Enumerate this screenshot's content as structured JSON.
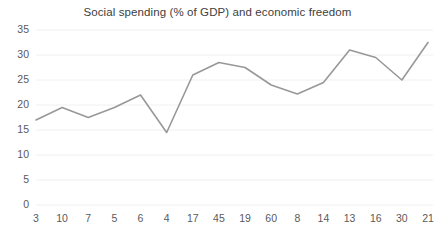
{
  "chart_data": {
    "type": "line",
    "title": "Social spending (% of GDP) and economic freedom",
    "xlabel": "",
    "ylabel": "",
    "categories": [
      "3",
      "10",
      "7",
      "5",
      "6",
      "4",
      "17",
      "45",
      "19",
      "60",
      "8",
      "14",
      "13",
      "16",
      "30",
      "21"
    ],
    "values": [
      17,
      19.5,
      17.5,
      19.5,
      22,
      14.5,
      26,
      28.5,
      27.5,
      24,
      22.2,
      24.5,
      31,
      29.5,
      25,
      32.5
    ],
    "series": [
      {
        "name": "Social spending (% of GDP)",
        "values": [
          17,
          19.5,
          17.5,
          19.5,
          22,
          14.5,
          26,
          28.5,
          27.5,
          24,
          22.2,
          24.5,
          31,
          29.5,
          25,
          32.5
        ]
      }
    ],
    "ylim": [
      0,
      35
    ],
    "yticks": [
      0,
      5,
      10,
      15,
      20,
      25,
      30,
      35
    ],
    "ytick_labels": [
      "0",
      "5",
      "10",
      "15",
      "20",
      "25",
      "30",
      "35"
    ],
    "grid": true,
    "grid_axis": "y",
    "legend": false,
    "legend_position": "none",
    "markers": false,
    "colors": {
      "line": "#989898",
      "grid": "#f0f0f0",
      "text": "#5a5a5a",
      "title": "#404040",
      "background": "#ffffff"
    }
  }
}
